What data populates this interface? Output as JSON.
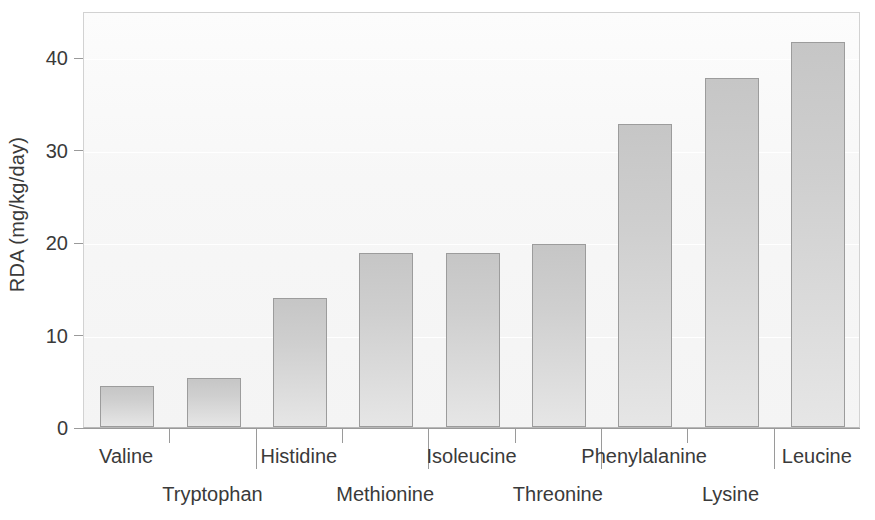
{
  "chart_data": {
    "type": "bar",
    "title": "",
    "subtitle": "",
    "xlabel": "",
    "ylabel": "RDA (mg/kg/day)",
    "categories": [
      "Valine",
      "Tryptophan",
      "Histidine",
      "Methionine",
      "Isoleucine",
      "Threonine",
      "Phenylalanine",
      "Lysine",
      "Leucine"
    ],
    "values": [
      4.4,
      5.3,
      14.0,
      18.8,
      18.8,
      19.8,
      32.8,
      37.8,
      41.7
    ],
    "ylim": [
      0,
      45
    ],
    "xlim": [
      0,
      9
    ],
    "y_ticks": [
      0,
      10,
      20,
      30,
      40
    ],
    "y_tick_labels": [
      "0",
      "10",
      "20",
      "30",
      "40"
    ],
    "grid": "horizontal-white",
    "legend": "none",
    "bar_fill_top": "#c6c6c6",
    "bar_fill_bottom": "#e6e6e6",
    "bar_border": "#9c9c9c",
    "plot_background": "#f7f7f7",
    "axis_color": "#9a9a9a",
    "text_color": "#3a3a3a",
    "label_stagger": [
      "row1",
      "row2",
      "row1",
      "row2",
      "row1",
      "row2",
      "row1",
      "row2",
      "row1"
    ]
  },
  "axes": {
    "y_title": "RDA (mg/kg/day)",
    "y_ticks": [
      {
        "label": "40",
        "value": 40
      },
      {
        "label": "30",
        "value": 30
      },
      {
        "label": "20",
        "value": 20
      },
      {
        "label": "10",
        "value": 10
      },
      {
        "label": "0",
        "value": 0
      }
    ]
  },
  "bars": [
    {
      "label": "Valine",
      "value": 4.4,
      "row": 1
    },
    {
      "label": "Tryptophan",
      "value": 5.3,
      "row": 2
    },
    {
      "label": "Histidine",
      "value": 14.0,
      "row": 1
    },
    {
      "label": "Methionine",
      "value": 18.8,
      "row": 2
    },
    {
      "label": "Isoleucine",
      "value": 18.8,
      "row": 1
    },
    {
      "label": "Threonine",
      "value": 19.8,
      "row": 2
    },
    {
      "label": "Phenylalanine",
      "value": 32.8,
      "row": 1
    },
    {
      "label": "Lysine",
      "value": 37.8,
      "row": 2
    },
    {
      "label": "Leucine",
      "value": 41.7,
      "row": 1
    }
  ]
}
